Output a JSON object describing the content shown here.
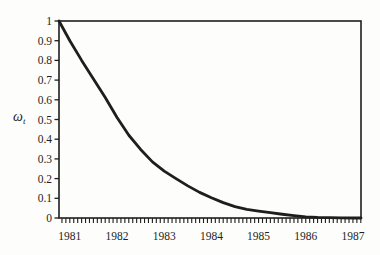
{
  "figure": {
    "background": "#fdfdfb",
    "ink_color": "#1e1e1e"
  },
  "chart_data": {
    "type": "line",
    "title": "",
    "xlabel": "",
    "ylabel": "ω_t",
    "ylabel_base": "ω",
    "ylabel_subscript": "t",
    "xlim": [
      1980.77,
      1987.17
    ],
    "ylim": [
      0,
      1
    ],
    "grid": false,
    "legend_position": "none",
    "frame": "full-box",
    "x_tick_values": [
      1981,
      1982,
      1983,
      1984,
      1985,
      1986,
      1987
    ],
    "x_tick_labels": [
      "1981",
      "1982",
      "1983",
      "1984",
      "1985",
      "1986",
      "1987"
    ],
    "x_minor_tick_step_years": 0.0833333,
    "y_tick_values": [
      0,
      0.1,
      0.2,
      0.3,
      0.4,
      0.5,
      0.6,
      0.7,
      0.8,
      0.9,
      1
    ],
    "y_tick_labels": [
      "0",
      "0.1",
      "0.2",
      "0.3",
      "0.4",
      "0.5",
      "0.6",
      "0.7",
      "0.8",
      "0.9",
      "1"
    ],
    "series": [
      {
        "name": "omega-weight-curve",
        "color": "#1e1e1e",
        "line_width": 2.8,
        "points": [
          [
            1980.77,
            1.0
          ],
          [
            1981.0,
            0.9
          ],
          [
            1981.25,
            0.8
          ],
          [
            1981.5,
            0.705
          ],
          [
            1981.75,
            0.612
          ],
          [
            1982.0,
            0.51
          ],
          [
            1982.25,
            0.42
          ],
          [
            1982.5,
            0.348
          ],
          [
            1982.75,
            0.285
          ],
          [
            1983.0,
            0.238
          ],
          [
            1983.25,
            0.2
          ],
          [
            1983.5,
            0.163
          ],
          [
            1983.75,
            0.13
          ],
          [
            1984.0,
            0.103
          ],
          [
            1984.25,
            0.078
          ],
          [
            1984.5,
            0.058
          ],
          [
            1984.75,
            0.044
          ],
          [
            1985.0,
            0.035
          ],
          [
            1985.25,
            0.027
          ],
          [
            1985.5,
            0.019
          ],
          [
            1985.75,
            0.012
          ],
          [
            1986.0,
            0.006
          ],
          [
            1986.25,
            0.003
          ],
          [
            1986.5,
            0.002
          ],
          [
            1986.75,
            0.001
          ],
          [
            1987.0,
            0.0
          ],
          [
            1987.17,
            0.0
          ]
        ]
      }
    ]
  }
}
